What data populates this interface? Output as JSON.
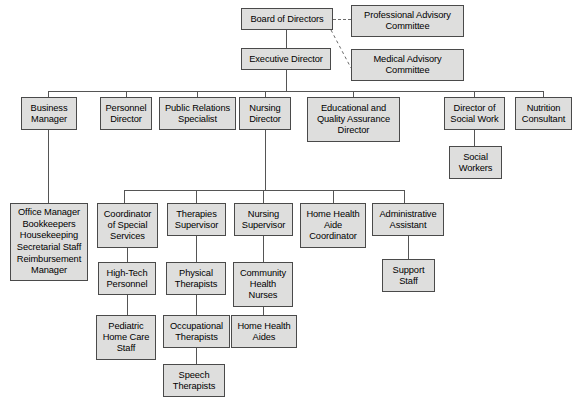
{
  "chart": {
    "type": "org-chart",
    "style": {
      "box_fill": "#dededd",
      "box_border": "#4a4a4a",
      "connector_color": "#555555",
      "dashed_connector_color": "#6b6b6b",
      "background": "#ffffff"
    },
    "nodes": [
      {
        "id": "board",
        "label": "Board of Directors",
        "x": 241,
        "y": 8,
        "w": 92,
        "h": 22
      },
      {
        "id": "prof_adv",
        "label": "Professional Advisory\nCommittee",
        "x": 351,
        "y": 5,
        "w": 113,
        "h": 32
      },
      {
        "id": "exec",
        "label": "Executive Director",
        "x": 241,
        "y": 48,
        "w": 90,
        "h": 22
      },
      {
        "id": "med_adv",
        "label": "Medical Advisory\nCommittee",
        "x": 351,
        "y": 49,
        "w": 113,
        "h": 32
      },
      {
        "id": "business",
        "label": "Business\nManager",
        "x": 21,
        "y": 97,
        "w": 56,
        "h": 33
      },
      {
        "id": "personnel",
        "label": "Personnel\nDirector",
        "x": 100,
        "y": 97,
        "w": 52,
        "h": 33
      },
      {
        "id": "public_rel",
        "label": "Public Relations\nSpecialist",
        "x": 159,
        "y": 97,
        "w": 77,
        "h": 33
      },
      {
        "id": "nursing_dir",
        "label": "Nursing\nDirector",
        "x": 239,
        "y": 97,
        "w": 52,
        "h": 33
      },
      {
        "id": "edu_qa",
        "label": "Educational and\nQuality Assurance\nDirector",
        "x": 307,
        "y": 97,
        "w": 93,
        "h": 45
      },
      {
        "id": "dir_social",
        "label": "Director of\nSocial Work",
        "x": 444,
        "y": 97,
        "w": 61,
        "h": 33
      },
      {
        "id": "nutrition",
        "label": "Nutrition\nConsultant",
        "x": 515,
        "y": 97,
        "w": 57,
        "h": 33
      },
      {
        "id": "social_wrk",
        "label": "Social\nWorkers",
        "x": 449,
        "y": 146,
        "w": 53,
        "h": 33
      },
      {
        "id": "office_list",
        "label": "Office Manager\nBookkeepers\nHousekeeping\nSecretarial Staff\nReimbursement\nManager",
        "x": 10,
        "y": 203,
        "w": 78,
        "h": 78,
        "list": true
      },
      {
        "id": "coord_spec",
        "label": "Coordinator\nof Special\nServices",
        "x": 97,
        "y": 203,
        "w": 61,
        "h": 45
      },
      {
        "id": "therapies_sup",
        "label": "Therapies\nSupervisor",
        "x": 167,
        "y": 203,
        "w": 59,
        "h": 33
      },
      {
        "id": "nursing_sup",
        "label": "Nursing\nSupervisor",
        "x": 234,
        "y": 203,
        "w": 59,
        "h": 33
      },
      {
        "id": "hha_coord",
        "label": "Home Health\nAide\nCoordinator",
        "x": 300,
        "y": 203,
        "w": 66,
        "h": 45
      },
      {
        "id": "admin_asst",
        "label": "Administrative\nAssistant",
        "x": 372,
        "y": 203,
        "w": 72,
        "h": 33
      },
      {
        "id": "hightech",
        "label": "High-Tech\nPersonnel",
        "x": 98,
        "y": 262,
        "w": 58,
        "h": 33
      },
      {
        "id": "physical_th",
        "label": "Physical\nTherapists",
        "x": 166,
        "y": 262,
        "w": 60,
        "h": 33
      },
      {
        "id": "comm_health",
        "label": "Community\nHealth\nNurses",
        "x": 233,
        "y": 262,
        "w": 60,
        "h": 45
      },
      {
        "id": "support_staff",
        "label": "Support\nStaff",
        "x": 382,
        "y": 259,
        "w": 53,
        "h": 33
      },
      {
        "id": "peds_home",
        "label": "Pediatric\nHome Care\nStaff",
        "x": 96,
        "y": 315,
        "w": 60,
        "h": 45
      },
      {
        "id": "occupational",
        "label": "Occupational\nTherapists",
        "x": 163,
        "y": 315,
        "w": 67,
        "h": 33
      },
      {
        "id": "hh_aides",
        "label": "Home Health\nAides",
        "x": 231,
        "y": 315,
        "w": 66,
        "h": 33
      },
      {
        "id": "speech_th",
        "label": "Speech\nTherapists",
        "x": 163,
        "y": 364,
        "w": 62,
        "h": 33
      }
    ],
    "connectors": {
      "solid": [
        {
          "name": "board-to-exec",
          "orient": "v",
          "x": 286,
          "y": 30,
          "len": 18
        },
        {
          "name": "exec-down-stem",
          "orient": "v",
          "x": 286,
          "y": 70,
          "len": 21
        },
        {
          "name": "level2-bus",
          "orient": "h",
          "x": 48,
          "y": 91,
          "len": 496
        },
        {
          "name": "drop-business",
          "orient": "v",
          "x": 48,
          "y": 91,
          "len": 6
        },
        {
          "name": "drop-personnel",
          "orient": "v",
          "x": 126,
          "y": 91,
          "len": 6
        },
        {
          "name": "drop-public-rel",
          "orient": "v",
          "x": 197,
          "y": 91,
          "len": 6
        },
        {
          "name": "drop-nursing-dir",
          "orient": "v",
          "x": 265,
          "y": 91,
          "len": 6
        },
        {
          "name": "drop-edu-qa",
          "orient": "v",
          "x": 353,
          "y": 91,
          "len": 6
        },
        {
          "name": "drop-dir-social",
          "orient": "v",
          "x": 474,
          "y": 91,
          "len": 6
        },
        {
          "name": "drop-nutrition",
          "orient": "v",
          "x": 543,
          "y": 91,
          "len": 6
        },
        {
          "name": "social-work-to-workers",
          "orient": "v",
          "x": 474,
          "y": 130,
          "len": 16
        },
        {
          "name": "business-to-office",
          "orient": "v",
          "x": 48,
          "y": 130,
          "len": 73
        },
        {
          "name": "nursing-dir-stem",
          "orient": "v",
          "x": 265,
          "y": 130,
          "len": 60
        },
        {
          "name": "level3-bus",
          "orient": "h",
          "x": 124,
          "y": 190,
          "len": 281
        },
        {
          "name": "drop-coord-spec",
          "orient": "v",
          "x": 124,
          "y": 190,
          "len": 13
        },
        {
          "name": "drop-therapies",
          "orient": "v",
          "x": 196,
          "y": 190,
          "len": 13
        },
        {
          "name": "drop-nursing-sup",
          "orient": "v",
          "x": 263,
          "y": 190,
          "len": 13
        },
        {
          "name": "drop-hha-coord",
          "orient": "v",
          "x": 333,
          "y": 190,
          "len": 13
        },
        {
          "name": "drop-admin-asst",
          "orient": "v",
          "x": 404,
          "y": 190,
          "len": 13
        },
        {
          "name": "coord-to-hightech",
          "orient": "v",
          "x": 127,
          "y": 248,
          "len": 14
        },
        {
          "name": "therapies-to-physical",
          "orient": "v",
          "x": 196,
          "y": 236,
          "len": 26
        },
        {
          "name": "nursing-sup-to-comm",
          "orient": "v",
          "x": 263,
          "y": 236,
          "len": 26
        },
        {
          "name": "hightech-to-peds",
          "orient": "v",
          "x": 127,
          "y": 295,
          "len": 20
        },
        {
          "name": "physical-to-occ",
          "orient": "v",
          "x": 196,
          "y": 295,
          "len": 20
        },
        {
          "name": "comm-to-aides",
          "orient": "v",
          "x": 263,
          "y": 307,
          "len": 8
        },
        {
          "name": "occ-to-speech",
          "orient": "v",
          "x": 196,
          "y": 348,
          "len": 16
        },
        {
          "name": "admin-elbow-down",
          "orient": "v",
          "x": 408,
          "y": 236,
          "len": 12
        },
        {
          "name": "admin-elbow-across",
          "orient": "h",
          "x": 408,
          "y": 248,
          "len": 1
        },
        {
          "name": "admin-to-support",
          "orient": "v",
          "x": 408,
          "y": 248,
          "len": 11
        }
      ],
      "dashed": [
        {
          "name": "board-to-professional-advisory",
          "type": "h",
          "x": 333,
          "y": 19,
          "len": 18
        },
        {
          "name": "board-to-medical-advisory",
          "type": "diag",
          "x1": 331,
          "y1": 30,
          "x2": 351,
          "y2": 68
        }
      ]
    }
  }
}
